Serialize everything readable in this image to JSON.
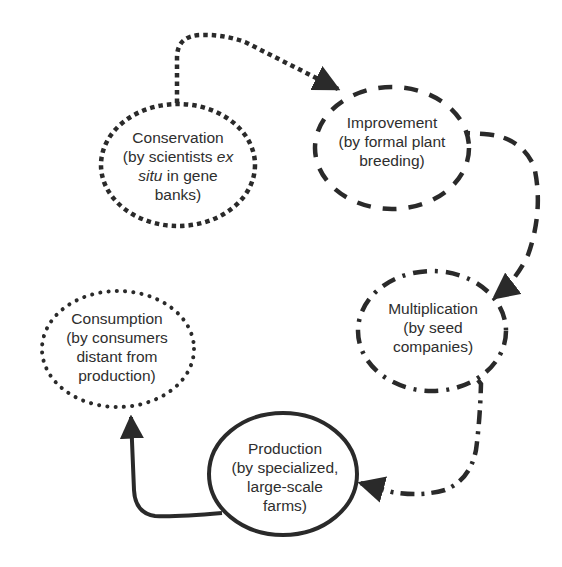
{
  "diagram": {
    "type": "cycle-flow",
    "colors": {
      "stroke": "#2a2a2a",
      "text": "#2e2e2e",
      "background": "#ffffff"
    },
    "nodes": [
      {
        "id": "conservation",
        "title": "Conservation",
        "lines": [
          "Conservation",
          "(by scientists ",
          "ex",
          "situ",
          " in gene",
          "banks)"
        ],
        "line1": "Conservation",
        "line2_pre": "(by scientists ",
        "line2_em": "ex",
        "line3_em": "situ",
        "line3_post": " in gene",
        "line4": "banks)",
        "border_style": "dotted-square",
        "cx": 178,
        "cy": 165,
        "rx": 77,
        "ry": 61
      },
      {
        "id": "improvement",
        "title": "Improvement",
        "line1": "Improvement",
        "line2": "(by formal plant",
        "line3": "breeding)",
        "border_style": "dashed",
        "cx": 392,
        "cy": 148,
        "rx": 77,
        "ry": 61
      },
      {
        "id": "multiplication",
        "title": "Multiplication",
        "line1": "Multiplication",
        "line2": "(by seed",
        "line3": "companies)",
        "border_style": "dash-dot",
        "cx": 432,
        "cy": 331,
        "rx": 74,
        "ry": 60
      },
      {
        "id": "production",
        "title": "Production",
        "line1": "Production",
        "line2": "(by specialized,",
        "line3": "large-scale",
        "line4": "farms)",
        "border_style": "solid",
        "cx": 283,
        "cy": 474,
        "rx": 74,
        "ry": 61
      },
      {
        "id": "consumption",
        "title": "Consumption",
        "line1": "Consumption",
        "line2": "(by consumers",
        "line3": "distant from",
        "line4": "production)",
        "border_style": "dotted-round",
        "cx": 118,
        "cy": 349,
        "rx": 76,
        "ry": 58
      }
    ],
    "edges": [
      {
        "from": "conservation",
        "to": "improvement",
        "style": "dotted-square"
      },
      {
        "from": "improvement",
        "to": "multiplication",
        "style": "dashed"
      },
      {
        "from": "multiplication",
        "to": "production",
        "style": "dash-dot"
      },
      {
        "from": "production",
        "to": "consumption",
        "style": "solid"
      }
    ]
  }
}
